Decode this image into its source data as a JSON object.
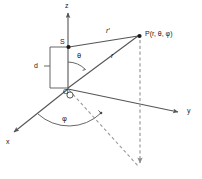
{
  "figure": {
    "type": "geometry-diagram",
    "background_color": "#ffffff",
    "line_color": "#555555",
    "text_color": "#1a1a1a",
    "width": 202,
    "height": 179
  },
  "axes": {
    "z": {
      "label": "z",
      "x": 65,
      "y": 2
    },
    "y": {
      "label": "y",
      "x": 187,
      "y": 107
    },
    "x": {
      "label": "x",
      "x": 6,
      "y": 138
    }
  },
  "points": {
    "origin": {
      "label": "O",
      "x": 63,
      "y": 88
    },
    "source": {
      "label": "S",
      "x": 60,
      "y": 38
    },
    "field_point": {
      "label": "P(r, θ, φ)",
      "x": 145,
      "y": 30
    }
  },
  "vectors": {
    "r_prime": {
      "label": "r′",
      "x": 106,
      "y": 27
    },
    "r": {
      "label": "r",
      "x": 111,
      "y": 52
    }
  },
  "angles": {
    "theta": {
      "label": "θ",
      "x": 77,
      "y": 52
    },
    "phi": {
      "label": "φ",
      "x": 62,
      "y": 115
    }
  },
  "dimensions": {
    "d": {
      "label": "d",
      "x": 34,
      "y": 62
    }
  }
}
